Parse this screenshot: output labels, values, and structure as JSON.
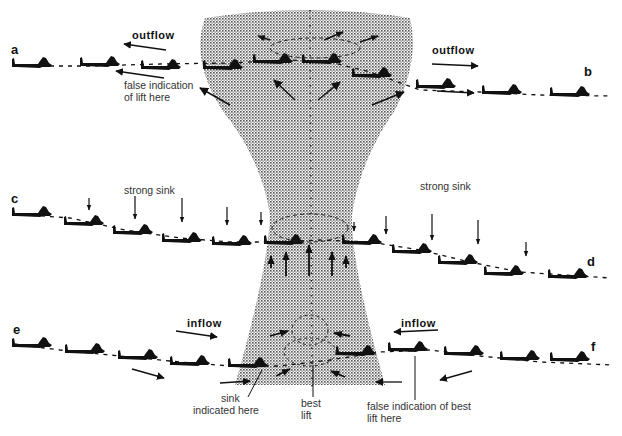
{
  "diagram": {
    "title": "",
    "colors": {
      "ink": "#111111",
      "stipple": "#555555",
      "background": "#ffffff"
    },
    "column": {
      "name": "thermal-column",
      "fill": "stippled grey"
    },
    "paths": [
      {
        "id": "a-b",
        "start_label": "a",
        "end_label": "b",
        "level": "top",
        "gliders": 10
      },
      {
        "id": "c-d",
        "start_label": "c",
        "end_label": "d",
        "level": "middle",
        "gliders": 10
      },
      {
        "id": "e-f",
        "start_label": "e",
        "end_label": "f",
        "level": "bottom",
        "gliders": 10
      }
    ],
    "labels": {
      "a": "a",
      "b": "b",
      "c": "c",
      "d": "d",
      "e": "e",
      "f": "f",
      "outflow_left": "outflow",
      "outflow_right": "outflow",
      "false_lift_line1": "false indication",
      "false_lift_line2": "of lift here",
      "strong_sink_left": "strong sink",
      "strong_sink_right": "strong sink",
      "inflow_left": "inflow",
      "inflow_right": "inflow",
      "sink_indicated_line1": "sink",
      "sink_indicated_line2": "indicated here",
      "best_lift_line1": "best",
      "best_lift_line2": "lift",
      "false_best_line1": "false indication of best",
      "false_best_line2": "lift here"
    }
  }
}
